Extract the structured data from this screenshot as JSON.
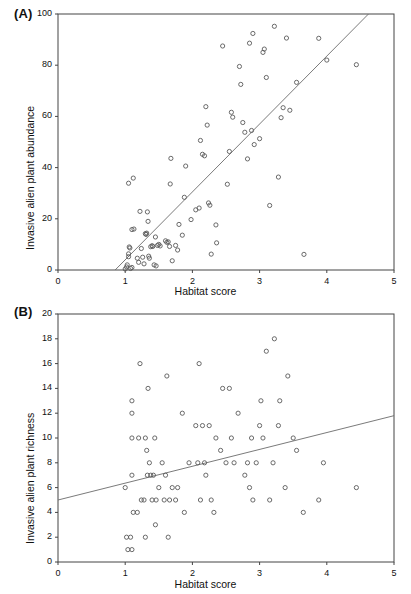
{
  "figure": {
    "panels": [
      "A",
      "B"
    ],
    "shared_xlabel": "Habitat score"
  },
  "panel_a": {
    "label": "(A)",
    "ylabel": "Invasive alien plant abundance",
    "xlabel": "Habitat score",
    "xticks": [
      "0",
      "1",
      "2",
      "3",
      "4",
      "5"
    ],
    "yticks": [
      "0",
      "20",
      "40",
      "60",
      "80",
      "100"
    ]
  },
  "panel_b": {
    "label": "(B)",
    "ylabel": "Invasive alien plant richness",
    "xlabel": "Habitat score",
    "xticks": [
      "0",
      "1",
      "2",
      "3",
      "4",
      "5"
    ],
    "yticks": [
      "0",
      "2",
      "4",
      "6",
      "8",
      "10",
      "12",
      "14",
      "16",
      "18",
      "20"
    ]
  },
  "chart_data": [
    {
      "type": "scatter",
      "panel": "A",
      "title": "",
      "xlabel": "Habitat score",
      "ylabel": "Invasive alien plant abundance",
      "xlim": [
        0,
        5
      ],
      "ylim": [
        0,
        100
      ],
      "xticks": [
        0,
        1,
        2,
        3,
        4,
        5
      ],
      "yticks": [
        0,
        20,
        40,
        60,
        80,
        100
      ],
      "grid": false,
      "legend": "none",
      "marker": "open-circle",
      "trendline": {
        "x": [
          0.85,
          4.62
        ],
        "y": [
          0,
          100
        ]
      },
      "points": [
        [
          1.0,
          0.4
        ],
        [
          1.02,
          1.2
        ],
        [
          1.03,
          2.0
        ],
        [
          1.05,
          5.2
        ],
        [
          1.05,
          6.3
        ],
        [
          1.06,
          9.0
        ],
        [
          1.07,
          8.6
        ],
        [
          1.08,
          0.6
        ],
        [
          1.1,
          1.0
        ],
        [
          1.1,
          15.8
        ],
        [
          1.12,
          35.9
        ],
        [
          1.13,
          16.0
        ],
        [
          1.05,
          33.9
        ],
        [
          1.18,
          4.6
        ],
        [
          1.2,
          3.0
        ],
        [
          1.22,
          22.9
        ],
        [
          1.24,
          8.4
        ],
        [
          1.26,
          5.0
        ],
        [
          1.28,
          2.4
        ],
        [
          1.3,
          14.2
        ],
        [
          1.31,
          13.9
        ],
        [
          1.32,
          14.4
        ],
        [
          1.33,
          22.7
        ],
        [
          1.34,
          19.0
        ],
        [
          1.35,
          5.4
        ],
        [
          1.36,
          4.6
        ],
        [
          1.38,
          9.1
        ],
        [
          1.4,
          9.5
        ],
        [
          1.41,
          9.2
        ],
        [
          1.43,
          2.0
        ],
        [
          1.45,
          12.9
        ],
        [
          1.46,
          1.6
        ],
        [
          1.48,
          9.6
        ],
        [
          1.5,
          10.0
        ],
        [
          1.52,
          9.4
        ],
        [
          1.6,
          11.4
        ],
        [
          1.62,
          10.8
        ],
        [
          1.64,
          11.0
        ],
        [
          1.66,
          9.2
        ],
        [
          1.67,
          33.6
        ],
        [
          1.68,
          43.6
        ],
        [
          1.7,
          3.6
        ],
        [
          1.75,
          9.6
        ],
        [
          1.78,
          7.8
        ],
        [
          1.8,
          17.8
        ],
        [
          1.85,
          13.6
        ],
        [
          1.88,
          28.4
        ],
        [
          1.9,
          40.6
        ],
        [
          1.98,
          19.7
        ],
        [
          2.05,
          23.5
        ],
        [
          2.1,
          24.2
        ],
        [
          2.12,
          50.6
        ],
        [
          2.15,
          45.2
        ],
        [
          2.18,
          44.6
        ],
        [
          2.2,
          63.8
        ],
        [
          2.22,
          56.6
        ],
        [
          2.24,
          26.2
        ],
        [
          2.26,
          25.3
        ],
        [
          2.28,
          6.2
        ],
        [
          2.35,
          17.6
        ],
        [
          2.36,
          10.6
        ],
        [
          2.45,
          87.5
        ],
        [
          2.52,
          33.5
        ],
        [
          2.55,
          46.3
        ],
        [
          2.58,
          61.6
        ],
        [
          2.6,
          59.7
        ],
        [
          2.7,
          79.5
        ],
        [
          2.72,
          72.5
        ],
        [
          2.75,
          57.6
        ],
        [
          2.78,
          53.8
        ],
        [
          2.82,
          43.4
        ],
        [
          2.85,
          88.6
        ],
        [
          2.88,
          54.5
        ],
        [
          2.9,
          92.4
        ],
        [
          2.92,
          49.0
        ],
        [
          3.0,
          51.3
        ],
        [
          3.05,
          85.0
        ],
        [
          3.07,
          86.3
        ],
        [
          3.1,
          75.2
        ],
        [
          3.15,
          25.2
        ],
        [
          3.22,
          95.2
        ],
        [
          3.28,
          36.3
        ],
        [
          3.32,
          59.5
        ],
        [
          3.35,
          63.4
        ],
        [
          3.4,
          90.6
        ],
        [
          3.45,
          62.4
        ],
        [
          3.55,
          73.3
        ],
        [
          3.66,
          6.1
        ],
        [
          3.88,
          90.5
        ],
        [
          4.0,
          82.0
        ],
        [
          4.44,
          80.2
        ]
      ]
    },
    {
      "type": "scatter",
      "panel": "B",
      "title": "",
      "xlabel": "Habitat score",
      "ylabel": "Invasive alien plant richness",
      "xlim": [
        0,
        5
      ],
      "ylim": [
        0,
        20
      ],
      "xticks": [
        0,
        1,
        2,
        3,
        4,
        5
      ],
      "yticks": [
        0,
        2,
        4,
        6,
        8,
        10,
        12,
        14,
        16,
        18,
        20
      ],
      "grid": false,
      "legend": "none",
      "marker": "open-circle",
      "trendline": {
        "x": [
          0,
          5
        ],
        "y": [
          5.0,
          11.8
        ]
      },
      "points": [
        [
          1.0,
          6
        ],
        [
          1.02,
          2
        ],
        [
          1.04,
          1
        ],
        [
          1.08,
          2
        ],
        [
          1.1,
          1
        ],
        [
          1.1,
          7
        ],
        [
          1.1,
          10
        ],
        [
          1.1,
          12
        ],
        [
          1.1,
          13
        ],
        [
          1.12,
          4
        ],
        [
          1.18,
          4
        ],
        [
          1.2,
          10
        ],
        [
          1.22,
          16
        ],
        [
          1.24,
          5
        ],
        [
          1.28,
          5
        ],
        [
          1.3,
          10
        ],
        [
          1.3,
          2
        ],
        [
          1.32,
          9
        ],
        [
          1.33,
          7
        ],
        [
          1.34,
          14
        ],
        [
          1.36,
          8
        ],
        [
          1.38,
          7
        ],
        [
          1.4,
          5
        ],
        [
          1.42,
          7
        ],
        [
          1.44,
          10
        ],
        [
          1.45,
          3
        ],
        [
          1.46,
          5
        ],
        [
          1.5,
          6
        ],
        [
          1.55,
          8
        ],
        [
          1.58,
          5
        ],
        [
          1.6,
          7
        ],
        [
          1.62,
          15
        ],
        [
          1.64,
          2
        ],
        [
          1.66,
          5
        ],
        [
          1.7,
          6
        ],
        [
          1.75,
          5
        ],
        [
          1.78,
          6
        ],
        [
          1.85,
          12
        ],
        [
          1.88,
          4
        ],
        [
          1.95,
          8
        ],
        [
          2.05,
          11
        ],
        [
          2.08,
          8
        ],
        [
          2.1,
          16
        ],
        [
          2.12,
          5
        ],
        [
          2.15,
          11
        ],
        [
          2.18,
          8
        ],
        [
          2.2,
          7
        ],
        [
          2.25,
          11
        ],
        [
          2.28,
          5
        ],
        [
          2.32,
          4
        ],
        [
          2.35,
          10
        ],
        [
          2.42,
          9
        ],
        [
          2.45,
          14
        ],
        [
          2.5,
          8
        ],
        [
          2.55,
          14
        ],
        [
          2.58,
          10
        ],
        [
          2.62,
          8
        ],
        [
          2.68,
          12
        ],
        [
          2.78,
          7
        ],
        [
          2.82,
          8
        ],
        [
          2.85,
          6
        ],
        [
          2.88,
          10
        ],
        [
          2.9,
          5
        ],
        [
          2.95,
          8
        ],
        [
          3.0,
          11
        ],
        [
          3.02,
          13
        ],
        [
          3.05,
          10
        ],
        [
          3.1,
          17
        ],
        [
          3.15,
          5
        ],
        [
          3.2,
          8
        ],
        [
          3.22,
          18
        ],
        [
          3.28,
          11
        ],
        [
          3.3,
          13
        ],
        [
          3.38,
          6
        ],
        [
          3.42,
          15
        ],
        [
          3.5,
          10
        ],
        [
          3.55,
          9
        ],
        [
          3.65,
          4
        ],
        [
          3.88,
          5
        ],
        [
          3.95,
          8
        ],
        [
          4.44,
          6
        ]
      ]
    }
  ]
}
